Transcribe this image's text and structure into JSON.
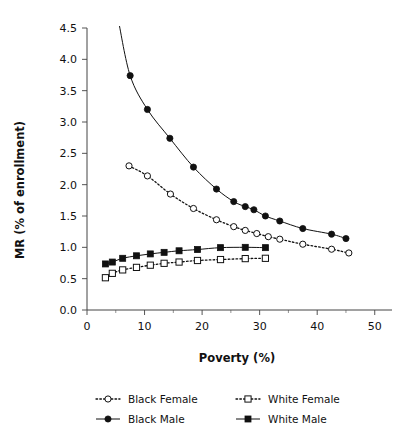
{
  "chart_data": {
    "type": "line",
    "title": "",
    "xlabel": "Poverty (%)",
    "ylabel": "MR (% of enrollment)",
    "xlim": [
      0,
      53
    ],
    "ylim": [
      0.0,
      4.5
    ],
    "grid": false,
    "legend_position": "bottom",
    "xticks": [
      0,
      10,
      20,
      30,
      40,
      50
    ],
    "xticks_minor": [
      5,
      15,
      25,
      35,
      45
    ],
    "yticks": [
      0.0,
      0.5,
      1.0,
      1.5,
      2.0,
      2.5,
      3.0,
      3.5,
      4.0,
      4.5
    ],
    "xtick_labels": [
      "0",
      "10",
      "20",
      "30",
      "40",
      "50"
    ],
    "ytick_labels": [
      "0.0",
      "0.5",
      "1.0",
      "1.5",
      "2.0",
      "2.5",
      "3.0",
      "3.5",
      "4.0",
      "4.5"
    ],
    "series": [
      {
        "name": "Black Male",
        "marker": "filled-circle",
        "line": "solid",
        "color": "#111111",
        "x": [
          5.5,
          7.5,
          10.5,
          14.4,
          18.5,
          22.5,
          25.5,
          27.5,
          29.0,
          31.0,
          33.5,
          37.5,
          42.5,
          45.0
        ],
        "y": [
          4.6,
          3.74,
          3.2,
          2.74,
          2.28,
          1.93,
          1.73,
          1.65,
          1.6,
          1.5,
          1.42,
          1.3,
          1.21,
          1.14
        ]
      },
      {
        "name": "Black Female",
        "marker": "open-circle",
        "line": "dotted",
        "color": "#111111",
        "x": [
          7.3,
          10.5,
          14.5,
          18.5,
          22.5,
          25.5,
          27.5,
          29.5,
          31.5,
          33.5,
          37.5,
          42.5,
          45.5
        ],
        "y": [
          2.3,
          2.14,
          1.85,
          1.62,
          1.44,
          1.33,
          1.27,
          1.22,
          1.17,
          1.13,
          1.05,
          0.97,
          0.91
        ]
      },
      {
        "name": "White Male",
        "marker": "filled-square",
        "line": "solid",
        "color": "#111111",
        "x": [
          3.2,
          4.4,
          6.2,
          8.6,
          11.0,
          13.4,
          16.0,
          19.2,
          23.2,
          27.5,
          31.0
        ],
        "y": [
          0.735,
          0.765,
          0.825,
          0.865,
          0.895,
          0.92,
          0.945,
          0.965,
          0.995,
          1.0,
          0.995
        ]
      },
      {
        "name": "White Female",
        "marker": "open-square",
        "line": "dotted",
        "color": "#111111",
        "x": [
          3.2,
          4.4,
          6.2,
          8.6,
          11.0,
          13.4,
          16.0,
          19.2,
          23.2,
          27.5,
          31.0
        ],
        "y": [
          0.515,
          0.585,
          0.64,
          0.68,
          0.715,
          0.745,
          0.765,
          0.79,
          0.805,
          0.82,
          0.825
        ]
      }
    ]
  },
  "legend": {
    "entries": [
      {
        "label": "Black Female",
        "marker": "open-circle",
        "line": "dotted"
      },
      {
        "label": "White Female",
        "marker": "open-square",
        "line": "dotted"
      },
      {
        "label": "Black Male",
        "marker": "filled-circle",
        "line": "solid"
      },
      {
        "label": "White Male",
        "marker": "filled-square",
        "line": "solid"
      }
    ]
  }
}
